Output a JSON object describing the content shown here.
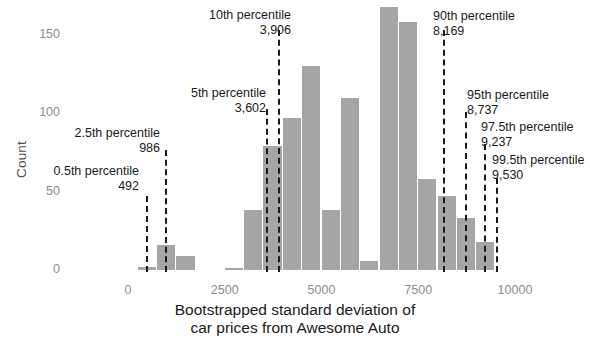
{
  "chart_data": {
    "type": "bar",
    "title": "",
    "xlabel": "Bootstrapped standard deviation of\ncar prices from Awesome Auto",
    "ylabel": "Count",
    "xlim": [
      -600,
      10400
    ],
    "ylim": [
      0,
      172
    ],
    "xticks": [
      0,
      2500,
      5000,
      7500,
      10000
    ],
    "xtick_labels": [
      "0",
      "2500",
      "5000",
      "7500",
      "10000"
    ],
    "yticks": [
      0,
      50,
      100,
      150
    ],
    "ytick_labels": [
      "0",
      "50",
      "100",
      "150"
    ],
    "grid": false,
    "legend": "none",
    "bar_color": "#a6a6a6",
    "bin_width": 500,
    "bins": [
      {
        "x0": 250,
        "x1": 750,
        "count": 2
      },
      {
        "x0": 750,
        "x1": 1250,
        "count": 16
      },
      {
        "x0": 1250,
        "x1": 1750,
        "count": 9
      },
      {
        "x0": 2500,
        "x1": 3000,
        "count": 1
      },
      {
        "x0": 3000,
        "x1": 3500,
        "count": 38
      },
      {
        "x0": 3500,
        "x1": 4000,
        "count": 79
      },
      {
        "x0": 4000,
        "x1": 4500,
        "count": 97
      },
      {
        "x0": 4500,
        "x1": 5000,
        "count": 130
      },
      {
        "x0": 5000,
        "x1": 5500,
        "count": 38
      },
      {
        "x0": 5500,
        "x1": 6000,
        "count": 110
      },
      {
        "x0": 6000,
        "x1": 6500,
        "count": 6
      },
      {
        "x0": 6500,
        "x1": 7000,
        "count": 168
      },
      {
        "x0": 7000,
        "x1": 7500,
        "count": 158
      },
      {
        "x0": 7500,
        "x1": 8000,
        "count": 58
      },
      {
        "x0": 8000,
        "x1": 8500,
        "count": 47
      },
      {
        "x0": 8500,
        "x1": 9000,
        "count": 33
      },
      {
        "x0": 9000,
        "x1": 9500,
        "count": 18
      }
    ],
    "annotations": [
      {
        "id": "p0_5",
        "name": "0.5th percentile",
        "value": 492,
        "value_label": "492",
        "align": "right"
      },
      {
        "id": "p2_5",
        "name": "2.5th percentile",
        "value": 986,
        "value_label": "986",
        "align": "right"
      },
      {
        "id": "p5",
        "name": "5th percentile",
        "value": 3602,
        "value_label": "3,602",
        "align": "right"
      },
      {
        "id": "p10",
        "name": "10th percentile",
        "value": 3906,
        "value_label": "3,906",
        "align": "right"
      },
      {
        "id": "p90",
        "name": "90th percentile",
        "value": 8169,
        "value_label": "8,169",
        "align": "left"
      },
      {
        "id": "p95",
        "name": "95th percentile",
        "value": 8737,
        "value_label": "8,737",
        "align": "left"
      },
      {
        "id": "p97_5",
        "name": "97.5th percentile",
        "value": 9237,
        "value_label": "9,237",
        "align": "left"
      },
      {
        "id": "p99_5",
        "name": "99.5th percentile",
        "value": 9530,
        "value_label": "9,530",
        "align": "left"
      }
    ]
  },
  "axis": {
    "y_title": "Count",
    "x_title": "Bootstrapped standard deviation of\ncar prices from Awesome Auto",
    "yticks": [
      "150",
      "100",
      "50",
      "0"
    ],
    "xticks": [
      "0",
      "2500",
      "5000",
      "7500",
      "10000"
    ]
  },
  "annotations_text": {
    "p0_5": {
      "name": "0.5th percentile",
      "value": "492"
    },
    "p2_5": {
      "name": "2.5th percentile",
      "value": "986"
    },
    "p5": {
      "name": "5th percentile",
      "value": "3,602"
    },
    "p10": {
      "name": "10th percentile",
      "value": "3,906"
    },
    "p90": {
      "name": "90th percentile",
      "value": "8,169"
    },
    "p95": {
      "name": "95th percentile",
      "value": "8,737"
    },
    "p97_5": {
      "name": "97.5th percentile",
      "value": "9,237"
    },
    "p99_5": {
      "name": "99.5th percentile",
      "value": "9,530"
    }
  }
}
